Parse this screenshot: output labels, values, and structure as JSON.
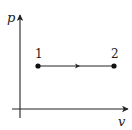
{
  "diagram": {
    "type": "p-v diagram",
    "title": "",
    "axes": {
      "y_label": "p",
      "x_label": "v"
    },
    "states": [
      {
        "label": "1",
        "x": 38,
        "y": 66
      },
      {
        "label": "2",
        "x": 114,
        "y": 66
      }
    ],
    "process": {
      "from": "1",
      "to": "2",
      "kind": "constant pressure",
      "direction": "left-to-right"
    },
    "colors": {
      "line": "#222222",
      "background": "#ffffff"
    }
  }
}
